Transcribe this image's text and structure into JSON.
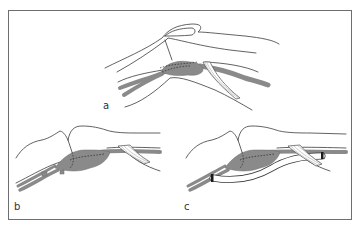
{
  "figure": {
    "type": "anatomical-illustration",
    "border_color": "#6e6e6e",
    "vessel_color": "#8a8a8a",
    "panels": [
      {
        "id": "a",
        "label": "a",
        "description": "lateral view of flexed knee showing aneurysmal popliteal vessel with dashed outline of mass beneath joint and fibrous band"
      },
      {
        "id": "b",
        "label": "b",
        "description": "knee with vessel ligated proximally and distally around the mass"
      },
      {
        "id": "c",
        "label": "c",
        "description": "knee with bypass graft placed alongside the excluded vessel, clamped at both ends"
      }
    ]
  }
}
